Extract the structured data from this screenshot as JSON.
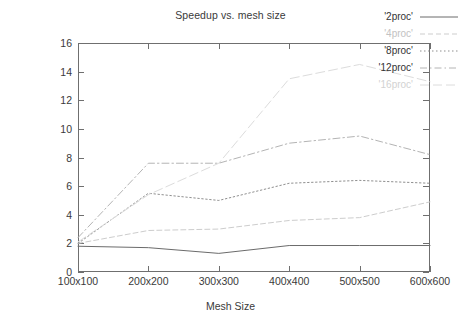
{
  "chart_data": {
    "type": "line",
    "title": "Speedup vs. mesh size",
    "xlabel": "Mesh Size",
    "ylabel": "Speedup",
    "categories": [
      "100x100",
      "200x200",
      "300x300",
      "400x400",
      "500x500",
      "600x600"
    ],
    "x_tick_labels": [
      "100x100",
      "200x200",
      "300x300",
      "400x400",
      "500x500",
      "600x600"
    ],
    "y_tick_labels": [
      "0",
      "2",
      "4",
      "6",
      "8",
      "10",
      "12",
      "14",
      "16"
    ],
    "y_ticks": [
      0,
      2,
      4,
      6,
      8,
      10,
      12,
      14,
      16
    ],
    "ylim": [
      0,
      16
    ],
    "xlim": [
      0,
      5
    ],
    "grid": false,
    "legend_position": "top-right",
    "series": [
      {
        "name": "'2proc'",
        "label": "'2proc'",
        "style": "solid",
        "color": "#6b6b6b",
        "values": [
          1.8,
          1.7,
          1.3,
          1.85,
          1.85,
          1.85
        ]
      },
      {
        "name": "'4proc'",
        "label": "'4proc'",
        "style": "dashed",
        "color": "#cdcdcd",
        "values": [
          2.0,
          2.9,
          3.0,
          3.6,
          3.8,
          4.9
        ]
      },
      {
        "name": "'8proc'",
        "label": "'8proc'",
        "style": "dotted",
        "color": "#8f8f8f",
        "values": [
          2.0,
          5.5,
          5.0,
          6.2,
          6.4,
          6.2
        ]
      },
      {
        "name": "'12proc'",
        "label": "'12proc'",
        "style": "dashdot",
        "color": "#b4b4b4",
        "values": [
          2.4,
          7.6,
          7.6,
          9.0,
          9.5,
          8.2
        ]
      },
      {
        "name": "'16proc'",
        "label": "'16proc'",
        "style": "longdash",
        "color": "#dcdcdc",
        "values": [
          2.1,
          5.4,
          7.6,
          13.5,
          14.5,
          13.3
        ]
      }
    ]
  }
}
